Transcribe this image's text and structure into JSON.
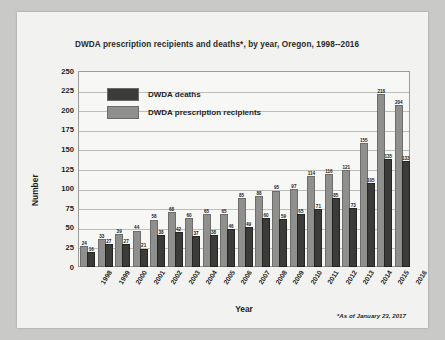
{
  "chart_data": {
    "type": "bar",
    "title": "DWDA prescription recipients and deaths*, by year, Oregon, 1998--2016",
    "xlabel": "Year",
    "ylabel": "Number",
    "ylim": [
      0,
      250
    ],
    "yticks": [
      0,
      25,
      50,
      75,
      100,
      125,
      150,
      175,
      200,
      225,
      250
    ],
    "grid": true,
    "legend_position": "inside-top-left",
    "categories": [
      "1998",
      "1999",
      "2000",
      "2001",
      "2002",
      "2003",
      "2004",
      "2005",
      "2006",
      "2007",
      "2008",
      "2009",
      "2010",
      "2011",
      "2012",
      "2013",
      "2014",
      "2015",
      "2016"
    ],
    "series": [
      {
        "name": "DWDA prescription recipients",
        "color": "#8f8f8d",
        "values": [
          24,
          33,
          39,
          44,
          58,
          68,
          60,
          65,
          65,
          85,
          88,
          95,
          97,
          114,
          116,
          121,
          155,
          218,
          204
        ]
      },
      {
        "name": "DWDA deaths",
        "color": "#3b3b39",
        "values": [
          16,
          27,
          27,
          21,
          38,
          42,
          37,
          38,
          46,
          49,
          60,
          59,
          65,
          71,
          85,
          73,
          105,
          135,
          133
        ]
      }
    ],
    "annotation": "*As of January 23, 2017"
  },
  "legend": {
    "items": [
      {
        "label": "DWDA deaths",
        "color": "#3b3b39"
      },
      {
        "label": "DWDA prescription recipients",
        "color": "#8f8f8d"
      }
    ]
  }
}
